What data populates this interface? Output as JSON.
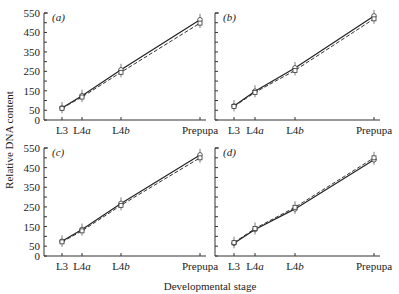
{
  "figure": {
    "ylabel": "Relative DNA content",
    "xlabel": "Developmental stage"
  },
  "chart_data": [
    {
      "type": "line",
      "panel": "(a)",
      "categories": [
        "L3",
        "L4a",
        "L4b",
        "Prepupa"
      ],
      "series": [
        {
          "name": "solid",
          "style": "solid",
          "values": [
            62,
            125,
            258,
            515
          ]
        },
        {
          "name": "dashed",
          "style": "dashed",
          "values": [
            60,
            118,
            245,
            498
          ]
        }
      ],
      "ylim": [
        0,
        550
      ],
      "yticks": [
        0,
        50,
        150,
        250,
        350,
        450,
        550
      ],
      "xlabel": "Developmental stage",
      "ylabel": "Relative DNA content"
    },
    {
      "type": "line",
      "panel": "(b)",
      "categories": [
        "L3",
        "L4a",
        "L4b",
        "Prepupa"
      ],
      "series": [
        {
          "name": "solid",
          "style": "solid",
          "values": [
            72,
            148,
            268,
            535
          ]
        },
        {
          "name": "dashed",
          "style": "dashed",
          "values": [
            70,
            142,
            255,
            520
          ]
        }
      ],
      "ylim": [
        0,
        550
      ],
      "yticks": [
        0,
        50,
        150,
        250,
        350,
        450,
        550
      ],
      "xlabel": "Developmental stage",
      "ylabel": "Relative DNA content"
    },
    {
      "type": "line",
      "panel": "(c)",
      "categories": [
        "L3",
        "L4a",
        "L4b",
        "Prepupa"
      ],
      "series": [
        {
          "name": "solid",
          "style": "solid",
          "values": [
            75,
            135,
            268,
            515
          ]
        },
        {
          "name": "dashed",
          "style": "dashed",
          "values": [
            72,
            128,
            258,
            500
          ]
        }
      ],
      "ylim": [
        0,
        550
      ],
      "yticks": [
        0,
        50,
        150,
        250,
        350,
        450,
        550
      ],
      "xlabel": "Developmental stage",
      "ylabel": "Relative DNA content"
    },
    {
      "type": "line",
      "panel": "(d)",
      "categories": [
        "L3",
        "L4a",
        "L4b",
        "Prepupa"
      ],
      "series": [
        {
          "name": "solid",
          "style": "solid",
          "values": [
            65,
            135,
            240,
            490
          ]
        },
        {
          "name": "dashed",
          "style": "dashed",
          "values": [
            68,
            140,
            248,
            500
          ]
        }
      ],
      "ylim": [
        0,
        550
      ],
      "yticks": [
        0,
        50,
        150,
        250,
        350,
        450,
        550
      ],
      "xlabel": "Developmental stage",
      "ylabel": "Relative DNA content"
    }
  ],
  "panels": [
    {
      "label": "(a)",
      "x_labels": [
        "L3",
        "L4a",
        "L4b",
        "Prepupa"
      ],
      "y_labels": [
        "550",
        "450",
        "350",
        "250",
        "150",
        "50",
        "0"
      ]
    },
    {
      "label": "(b)",
      "x_labels": [
        "L3",
        "L4a",
        "L4b",
        "Prepupa"
      ]
    },
    {
      "label": "(c)",
      "x_labels": [
        "L3",
        "L4a",
        "L4b",
        "Prepupa"
      ],
      "y_labels": [
        "550",
        "450",
        "350",
        "250",
        "150",
        "50",
        "0"
      ]
    },
    {
      "label": "(d)",
      "x_labels": [
        "L3",
        "L4a",
        "L4b",
        "Prepupa"
      ]
    }
  ]
}
